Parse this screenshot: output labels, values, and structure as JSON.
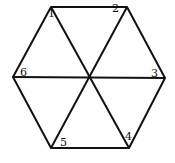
{
  "diagram": {
    "title": "",
    "shape": "hexagon divided into 6 triangles",
    "stroke_color": "#111111",
    "background": "#ffffff",
    "vertices": {
      "top_left": [
        51,
        7
      ],
      "top_right": [
        127,
        7
      ],
      "right": [
        165,
        78
      ],
      "bottom_right": [
        129,
        148
      ],
      "bottom_left": [
        51,
        148
      ],
      "left": [
        13,
        77
      ],
      "center": [
        90,
        78
      ]
    },
    "labels": [
      {
        "text": "1",
        "x": 48,
        "y": 17
      },
      {
        "text": "2",
        "x": 112,
        "y": 12
      },
      {
        "text": "3",
        "x": 151,
        "y": 68
      },
      {
        "text": "4",
        "x": 125,
        "y": 133
      },
      {
        "text": "5",
        "x": 60,
        "y": 138
      },
      {
        "text": "6",
        "x": 20,
        "y": 68
      }
    ]
  }
}
